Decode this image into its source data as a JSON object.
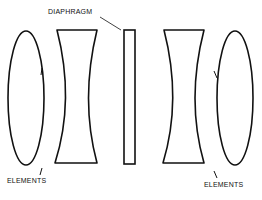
{
  "diagram": {
    "labels": {
      "diaphragm": "DIAPHRAGM",
      "elements_left": "ELEMENTS",
      "elements_right": "ELEMENTS"
    },
    "components": [
      {
        "name": "left-biconvex-element",
        "type": "biconvex lens"
      },
      {
        "name": "left-biconcave-element",
        "type": "biconcave lens"
      },
      {
        "name": "diaphragm",
        "type": "aperture stop"
      },
      {
        "name": "right-biconcave-element",
        "type": "biconcave lens"
      },
      {
        "name": "right-biconvex-element",
        "type": "biconvex lens"
      }
    ],
    "colors": {
      "line": "#111111",
      "background": "#ffffff"
    }
  }
}
